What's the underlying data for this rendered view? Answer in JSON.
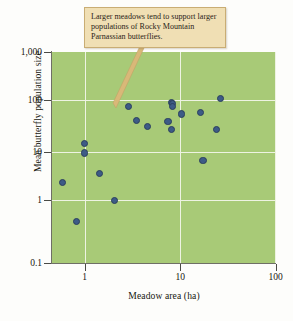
{
  "figure": {
    "annotation": {
      "text": "Larger meadows tend to support larger populations of Rocky Mountain Parnassian butterflies.",
      "fill_color": "#f0dfb4",
      "border_color": "#c9ad74"
    },
    "plot_background_color": "#a8ca77",
    "gridline_color": "#eef3e2",
    "point_color": "#3d5b86"
  },
  "chart_data": {
    "type": "scatter",
    "title": "",
    "xlabel": "Meadow area (ha)",
    "ylabel": "Mean butterfly population size",
    "xscale": "log",
    "yscale": "log",
    "xlim": [
      0.5,
      100
    ],
    "ylim": [
      0.1,
      1000
    ],
    "xticks": [
      1,
      10,
      100
    ],
    "xtick_labels": [
      "1",
      "10",
      "100"
    ],
    "yticks": [
      0.1,
      1,
      10,
      100,
      1000
    ],
    "ytick_labels": [
      "0.1",
      "1",
      "10",
      "100",
      "1,000"
    ],
    "grid": true,
    "legend": null,
    "annotations": [
      {
        "text": "Larger meadows tend to support larger populations of Rocky Mountain Parnassian butterflies.",
        "points_to": [
          3.4,
          170
        ]
      }
    ],
    "points": [
      {
        "x": 0.59,
        "y": 2.9
      },
      {
        "x": 0.82,
        "y": 0.52
      },
      {
        "x": 1.0,
        "y": 16.5
      },
      {
        "x": 1.0,
        "y": 10.9
      },
      {
        "x": 1.45,
        "y": 4.4
      },
      {
        "x": 2.05,
        "y": 1.33
      },
      {
        "x": 2.9,
        "y": 88
      },
      {
        "x": 3.5,
        "y": 47
      },
      {
        "x": 4.6,
        "y": 35
      },
      {
        "x": 8.1,
        "y": 105
      },
      {
        "x": 8.4,
        "y": 98
      },
      {
        "x": 8.4,
        "y": 86
      },
      {
        "x": 7.5,
        "y": 44
      },
      {
        "x": 8.1,
        "y": 31
      },
      {
        "x": 10.3,
        "y": 62
      },
      {
        "x": 16.6,
        "y": 66
      },
      {
        "x": 17.5,
        "y": 7.8
      },
      {
        "x": 26.5,
        "y": 125
      },
      {
        "x": 24.0,
        "y": 31
      }
    ]
  },
  "axes": {
    "y": {
      "labels": [
        "1,000",
        "100",
        "10",
        "1",
        "0.1"
      ],
      "title": "Mean butterfly population size"
    },
    "x": {
      "labels": [
        "1",
        "10",
        "100"
      ],
      "title": "Meadow area (ha)"
    }
  }
}
